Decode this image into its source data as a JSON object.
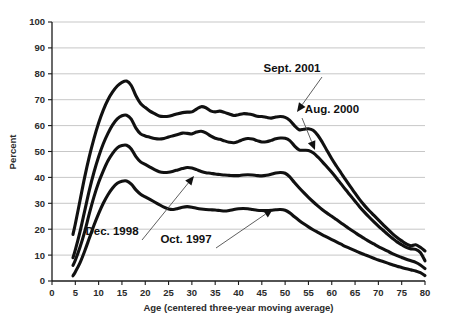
{
  "chart_data": {
    "type": "line",
    "title": "",
    "xlabel": "Age (centered three-year moving average)",
    "ylabel": "Percent",
    "xlim": [
      0,
      80
    ],
    "ylim": [
      0,
      100
    ],
    "xticks": [
      0,
      5,
      10,
      15,
      20,
      25,
      30,
      35,
      40,
      45,
      50,
      55,
      60,
      65,
      70,
      75,
      80
    ],
    "yticks": [
      0,
      10,
      20,
      30,
      40,
      50,
      60,
      70,
      80,
      90,
      100
    ],
    "grid": "horizontal",
    "legend_position": "inline-annotations",
    "x": [
      4.5,
      5,
      6,
      7,
      8,
      9,
      10,
      11,
      12,
      13,
      14,
      15,
      16,
      17,
      18,
      19,
      20,
      21,
      22,
      23,
      24,
      25,
      26,
      27,
      28,
      29,
      30,
      31,
      32,
      33,
      34,
      35,
      36,
      37,
      38,
      39,
      40,
      41,
      42,
      43,
      44,
      45,
      46,
      47,
      48,
      49,
      50,
      51,
      52,
      53,
      54,
      55,
      56,
      57,
      58,
      59,
      60,
      61,
      62,
      63,
      64,
      65,
      66,
      67,
      68,
      69,
      70,
      71,
      72,
      73,
      74,
      75,
      76,
      77,
      78,
      79,
      80
    ],
    "series": [
      {
        "name": "Sept. 2001",
        "values": [
          18.0,
          22.0,
          31.0,
          40.0,
          48.0,
          55.0,
          61.0,
          66.0,
          70.0,
          73.0,
          75.3,
          76.7,
          77.2,
          75.5,
          71.5,
          68.5,
          67.0,
          65.6,
          64.6,
          63.7,
          63.5,
          63.6,
          64.1,
          64.6,
          65.0,
          65.2,
          65.3,
          66.4,
          67.3,
          66.9,
          65.7,
          65.3,
          65.6,
          65.1,
          64.5,
          63.9,
          64.2,
          64.6,
          64.5,
          64.2,
          63.6,
          63.5,
          63.2,
          62.9,
          63.3,
          63.5,
          63.2,
          62.0,
          60.0,
          58.4,
          58.6,
          58.8,
          58.2,
          56.3,
          53.5,
          50.3,
          47.2,
          44.4,
          41.7,
          39.0,
          36.4,
          33.9,
          31.4,
          29.2,
          27.2,
          25.4,
          23.6,
          21.8,
          20.0,
          18.3,
          16.8,
          15.5,
          14.3,
          13.6,
          14.0,
          13.0,
          11.6
        ]
      },
      {
        "name": "Aug. 2000",
        "values": [
          9.0,
          12.0,
          19.0,
          27.0,
          35.0,
          42.0,
          48.0,
          53.0,
          57.0,
          60.3,
          62.6,
          63.8,
          64.0,
          62.5,
          59.0,
          56.8,
          56.0,
          55.5,
          55.0,
          54.8,
          55.0,
          55.6,
          56.1,
          56.6,
          57.1,
          57.0,
          56.8,
          57.5,
          57.8,
          57.2,
          56.0,
          55.1,
          54.7,
          54.1,
          53.6,
          53.4,
          53.9,
          54.6,
          55.0,
          54.8,
          54.2,
          53.7,
          53.8,
          54.3,
          54.9,
          55.2,
          55.1,
          54.2,
          52.2,
          50.6,
          50.5,
          50.4,
          49.5,
          47.9,
          46.0,
          44.0,
          42.0,
          39.8,
          37.5,
          35.2,
          33.0,
          30.8,
          28.6,
          26.6,
          24.7,
          22.9,
          21.2,
          19.6,
          18.0,
          16.5,
          15.1,
          14.0,
          13.0,
          12.4,
          12.2,
          11.0,
          7.8
        ]
      },
      {
        "name": "Dec. 1998",
        "values": [
          6.0,
          8.0,
          13.0,
          19.0,
          26.0,
          32.5,
          38.0,
          42.5,
          46.4,
          49.3,
          51.4,
          52.3,
          52.4,
          51.0,
          48.0,
          46.0,
          45.0,
          44.0,
          43.0,
          42.2,
          41.9,
          42.0,
          42.4,
          42.9,
          43.4,
          43.8,
          43.6,
          43.0,
          42.3,
          41.8,
          41.6,
          41.3,
          41.1,
          40.9,
          40.8,
          40.7,
          40.7,
          40.9,
          41.0,
          40.9,
          40.7,
          40.6,
          40.8,
          41.2,
          41.7,
          41.9,
          41.6,
          40.2,
          38.0,
          36.0,
          34.1,
          32.3,
          30.6,
          29.0,
          27.5,
          26.2,
          25.0,
          23.7,
          22.4,
          21.1,
          19.9,
          18.7,
          17.5,
          16.4,
          15.3,
          14.3,
          13.3,
          12.4,
          11.5,
          10.6,
          9.8,
          9.1,
          8.4,
          7.8,
          7.2,
          6.2,
          4.8
        ]
      },
      {
        "name": "Oct. 1997",
        "values": [
          2.0,
          3.5,
          7.0,
          11.5,
          16.5,
          21.5,
          26.0,
          30.0,
          33.3,
          35.9,
          37.7,
          38.5,
          38.6,
          37.4,
          35.2,
          33.5,
          32.5,
          31.5,
          30.5,
          29.5,
          28.5,
          27.8,
          27.6,
          28.0,
          28.5,
          28.7,
          28.5,
          28.1,
          27.8,
          27.6,
          27.5,
          27.4,
          27.2,
          27.0,
          27.2,
          27.6,
          27.9,
          28.0,
          27.9,
          27.6,
          27.3,
          27.2,
          27.2,
          27.3,
          27.5,
          27.6,
          27.3,
          26.3,
          24.8,
          23.4,
          22.1,
          20.9,
          19.8,
          18.8,
          17.8,
          16.9,
          16.0,
          15.1,
          14.2,
          13.3,
          12.5,
          11.7,
          10.9,
          10.2,
          9.5,
          8.8,
          8.1,
          7.5,
          6.9,
          6.3,
          5.7,
          5.2,
          4.7,
          4.3,
          3.9,
          3.2,
          2.1
        ]
      }
    ],
    "annotations": [
      {
        "text": "Sept. 2001",
        "label_x": 292,
        "label_y": 72,
        "tip_x": 297,
        "tip_y": 112
      },
      {
        "text": "Aug. 2000",
        "label_x": 332,
        "label_y": 113,
        "tip_x": 315,
        "tip_y": 150
      },
      {
        "text": "Dec. 1998",
        "label_x": 112,
        "label_y": 235,
        "tip_x": 194,
        "tip_y": 176
      },
      {
        "text": "Oct. 1997",
        "label_x": 186,
        "label_y": 243,
        "tip_x": 273,
        "tip_y": 209
      }
    ],
    "colors": {
      "line": "#111111",
      "grid": "#b9b9b9",
      "axis": "#1a1a1a",
      "background": "#ffffff"
    }
  }
}
